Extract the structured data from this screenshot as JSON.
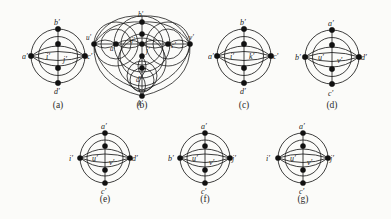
{
  "figure": {
    "background_color": "#fbfbf9",
    "ink_color": "#1c1c1c",
    "node_color": "#111111"
  },
  "panels": [
    {
      "id": "a",
      "caption": "(a)",
      "nodes": [
        {
          "name": "b-prime",
          "label": "b′",
          "pos": "top"
        },
        {
          "name": "a-prime",
          "label": "a′",
          "pos": "left"
        },
        {
          "name": "c-prime",
          "label": "c′",
          "pos": "right"
        },
        {
          "name": "d-prime",
          "label": "d′",
          "pos": "bottom"
        },
        {
          "name": "i-prime",
          "label": "i′",
          "pos": "inner-upper"
        },
        {
          "name": "j-prime",
          "label": "j′",
          "pos": "inner-lower"
        }
      ]
    },
    {
      "id": "b",
      "caption": "(b)",
      "nodes": [
        {
          "name": "b-prime",
          "label": "b′",
          "pos": "top"
        },
        {
          "name": "u-prime",
          "label": "u′",
          "pos": "far-left"
        },
        {
          "name": "v-prime",
          "label": "v′",
          "pos": "far-right"
        },
        {
          "name": "a-prime",
          "label": "a′",
          "pos": "left"
        },
        {
          "name": "c-prime",
          "label": "c′",
          "pos": "right"
        },
        {
          "name": "i-prime",
          "label": "i′",
          "pos": "center-left"
        },
        {
          "name": "j-prime",
          "label": "j′",
          "pos": "center-right"
        },
        {
          "name": "d-prime",
          "label": "d′",
          "pos": "lower"
        },
        {
          "name": "k-prime",
          "label": "k′",
          "pos": "bottom"
        }
      ]
    },
    {
      "id": "c",
      "caption": "(c)",
      "nodes": [
        {
          "name": "b-prime",
          "label": "b′",
          "pos": "top"
        },
        {
          "name": "a-prime",
          "label": "a′",
          "pos": "left"
        },
        {
          "name": "c-prime",
          "label": "c′",
          "pos": "right"
        },
        {
          "name": "d-prime",
          "label": "d′",
          "pos": "bottom"
        },
        {
          "name": "i-prime",
          "label": "i′",
          "pos": "inner-left"
        },
        {
          "name": "k-prime",
          "label": "k′",
          "pos": "inner-right"
        }
      ]
    },
    {
      "id": "d",
      "caption": "(d)",
      "nodes": [
        {
          "name": "a-prime",
          "label": "a′",
          "pos": "top"
        },
        {
          "name": "b-prime",
          "label": "b′",
          "pos": "left"
        },
        {
          "name": "d-prime",
          "label": "d′",
          "pos": "right"
        },
        {
          "name": "c-prime",
          "label": "c′",
          "pos": "bottom"
        },
        {
          "name": "u-prime",
          "label": "u′",
          "pos": "inner-left"
        },
        {
          "name": "v-prime",
          "label": "v′",
          "pos": "inner-right"
        }
      ]
    },
    {
      "id": "e",
      "caption": "(e)",
      "nodes": [
        {
          "name": "a-prime",
          "label": "a′",
          "pos": "top"
        },
        {
          "name": "i-prime",
          "label": "i′",
          "pos": "left"
        },
        {
          "name": "d-prime",
          "label": "d′",
          "pos": "right"
        },
        {
          "name": "c-prime",
          "label": "c′",
          "pos": "bottom"
        },
        {
          "name": "u-prime",
          "label": "u′",
          "pos": "inner-left"
        },
        {
          "name": "v-prime",
          "label": "v′",
          "pos": "inner-right"
        }
      ]
    },
    {
      "id": "f",
      "caption": "(f)",
      "nodes": [
        {
          "name": "a-prime",
          "label": "a′",
          "pos": "top"
        },
        {
          "name": "b-prime",
          "label": "b′",
          "pos": "left"
        },
        {
          "name": "j-prime",
          "label": "j′",
          "pos": "right"
        },
        {
          "name": "c-prime",
          "label": "c′",
          "pos": "bottom"
        },
        {
          "name": "u-prime",
          "label": "u′",
          "pos": "inner-left"
        },
        {
          "name": "v-prime",
          "label": "v′",
          "pos": "inner-right"
        }
      ]
    },
    {
      "id": "g",
      "caption": "(g)",
      "nodes": [
        {
          "name": "a-prime",
          "label": "a′",
          "pos": "top"
        },
        {
          "name": "i-prime",
          "label": "i′",
          "pos": "left"
        },
        {
          "name": "j-prime",
          "label": "j′",
          "pos": "right"
        },
        {
          "name": "c-prime",
          "label": "c′",
          "pos": "bottom"
        },
        {
          "name": "u-prime",
          "label": "u′",
          "pos": "inner-left"
        },
        {
          "name": "v-prime",
          "label": "v′",
          "pos": "inner-right"
        }
      ]
    }
  ]
}
